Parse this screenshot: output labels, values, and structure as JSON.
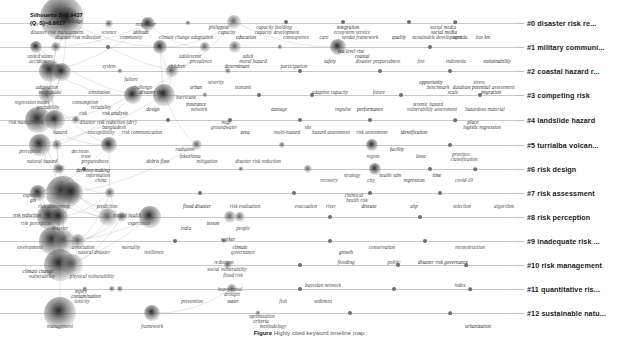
{
  "figure": {
    "type": "timeline-knowledge-map",
    "metrics_line1": "Silhouette S=0.9437",
    "metrics_line2": "(Q, S)=0.8617",
    "caption_label": "Figure",
    "caption_text": "Highly cited keyword timeline map"
  },
  "clusters": [
    {
      "id": "#0",
      "label": "#0 disaster risk re...",
      "y": 23
    },
    {
      "id": "#1",
      "label": "#1 military communi...",
      "y": 47
    },
    {
      "id": "#2",
      "label": "#2 coastal hazard r...",
      "y": 71
    },
    {
      "id": "#3",
      "label": "#3 competing risk",
      "y": 95
    },
    {
      "id": "#4",
      "label": "#4 landslide hazard",
      "y": 120
    },
    {
      "id": "#5",
      "label": "#5 turrialba volcan...",
      "y": 145
    },
    {
      "id": "#6",
      "label": "#6 risk design",
      "y": 169
    },
    {
      "id": "#7",
      "label": "#7 risk assessment",
      "y": 193
    },
    {
      "id": "#8",
      "label": "#8 risk perception",
      "y": 217
    },
    {
      "id": "#9",
      "label": "#9 inadequate risk ...",
      "y": 241
    },
    {
      "id": "#10",
      "label": "#10 risk management",
      "y": 265
    },
    {
      "id": "#11",
      "label": "#11 quantitative ris...",
      "y": 289
    },
    {
      "id": "#12",
      "label": "#12 sustainable natu...",
      "y": 313
    }
  ],
  "terms": [
    {
      "t": "knowledge",
      "x": 72,
      "y": 22
    },
    {
      "t": "responder",
      "x": 146,
      "y": 25
    },
    {
      "t": "philippine",
      "x": 219,
      "y": 28
    },
    {
      "t": "capacity building",
      "x": 274,
      "y": 28
    },
    {
      "t": "integration",
      "x": 348,
      "y": 28
    },
    {
      "t": "social media",
      "x": 443,
      "y": 28
    },
    {
      "t": "disaster risk management",
      "x": 57,
      "y": 33
    },
    {
      "t": "science",
      "x": 109,
      "y": 33
    },
    {
      "t": "attitude",
      "x": 141,
      "y": 33
    },
    {
      "t": "capacity",
      "x": 227,
      "y": 33
    },
    {
      "t": "capacity development",
      "x": 277,
      "y": 33
    },
    {
      "t": "ecosystem service",
      "x": 352,
      "y": 33
    },
    {
      "t": "social media",
      "x": 444,
      "y": 33
    },
    {
      "t": "disaster risk reduction",
      "x": 78,
      "y": 38
    },
    {
      "t": "community",
      "x": 131,
      "y": 38
    },
    {
      "t": "climate change adaptation",
      "x": 186,
      "y": 38
    },
    {
      "t": "education",
      "x": 246,
      "y": 38
    },
    {
      "t": "consequence",
      "x": 296,
      "y": 38
    },
    {
      "t": "care",
      "x": 324,
      "y": 38
    },
    {
      "t": "sendai framework",
      "x": 360,
      "y": 38
    },
    {
      "t": "quality",
      "x": 399,
      "y": 38
    },
    {
      "t": "sustainable development",
      "x": 437,
      "y": 38
    },
    {
      "t": "agenda",
      "x": 460,
      "y": 38
    },
    {
      "t": "bus km",
      "x": 483,
      "y": 38
    },
    {
      "t": "sea level rise",
      "x": 351,
      "y": 52
    },
    {
      "t": "united states",
      "x": 40,
      "y": 57
    },
    {
      "t": "adolescent",
      "x": 190,
      "y": 57
    },
    {
      "t": "adult",
      "x": 248,
      "y": 57
    },
    {
      "t": "coastal",
      "x": 362,
      "y": 57
    },
    {
      "t": "accident",
      "x": 38,
      "y": 62
    },
    {
      "t": "prevalence",
      "x": 201,
      "y": 62
    },
    {
      "t": "moral hazard",
      "x": 253,
      "y": 62
    },
    {
      "t": "safety",
      "x": 330,
      "y": 62
    },
    {
      "t": "disaster preparedness",
      "x": 378,
      "y": 62
    },
    {
      "t": "fire",
      "x": 421,
      "y": 62
    },
    {
      "t": "indonesia",
      "x": 456,
      "y": 62
    },
    {
      "t": "sustainability",
      "x": 497,
      "y": 62
    },
    {
      "t": "disability",
      "x": 52,
      "y": 67
    },
    {
      "t": "system",
      "x": 109,
      "y": 67
    },
    {
      "t": "children",
      "x": 177,
      "y": 67
    },
    {
      "t": "determinant",
      "x": 237,
      "y": 67
    },
    {
      "t": "participation",
      "x": 294,
      "y": 67
    },
    {
      "t": "failure",
      "x": 131,
      "y": 80
    },
    {
      "t": "severity",
      "x": 216,
      "y": 83
    },
    {
      "t": "opportunity",
      "x": 431,
      "y": 83
    },
    {
      "t": "stress",
      "x": 479,
      "y": 83
    },
    {
      "t": "adaptation",
      "x": 47,
      "y": 88
    },
    {
      "t": "challenge",
      "x": 142,
      "y": 88
    },
    {
      "t": "urban",
      "x": 196,
      "y": 88
    },
    {
      "t": "tsunami",
      "x": 243,
      "y": 88
    },
    {
      "t": "benchmark",
      "x": 438,
      "y": 88
    },
    {
      "t": "database",
      "x": 462,
      "y": 88
    },
    {
      "t": "potential",
      "x": 481,
      "y": 88
    },
    {
      "t": "assessment",
      "x": 503,
      "y": 88
    },
    {
      "t": "earthquake",
      "x": 50,
      "y": 93
    },
    {
      "t": "simulation",
      "x": 99,
      "y": 93
    },
    {
      "t": "disaster risk",
      "x": 152,
      "y": 93
    },
    {
      "t": "adaptive capacity",
      "x": 330,
      "y": 93
    },
    {
      "t": "future",
      "x": 379,
      "y": 93
    },
    {
      "t": "scale",
      "x": 453,
      "y": 93
    },
    {
      "t": "migration",
      "x": 491,
      "y": 93
    },
    {
      "t": "hurricane",
      "x": 186,
      "y": 98
    },
    {
      "t": "regression model",
      "x": 32,
      "y": 103
    },
    {
      "t": "consumption",
      "x": 85,
      "y": 103
    },
    {
      "t": "insurance",
      "x": 196,
      "y": 105
    },
    {
      "t": "seismic hazard",
      "x": 428,
      "y": 105
    },
    {
      "t": "probability",
      "x": 48,
      "y": 108
    },
    {
      "t": "reliability",
      "x": 101,
      "y": 108
    },
    {
      "t": "design",
      "x": 153,
      "y": 110
    },
    {
      "t": "network",
      "x": 199,
      "y": 110
    },
    {
      "t": "damage",
      "x": 279,
      "y": 110
    },
    {
      "t": "impulse",
      "x": 343,
      "y": 110
    },
    {
      "t": "performance",
      "x": 370,
      "y": 110
    },
    {
      "t": "vulnerability assessment",
      "x": 432,
      "y": 110
    },
    {
      "t": "hazardous material",
      "x": 485,
      "y": 110
    },
    {
      "t": "risk",
      "x": 83,
      "y": 114
    },
    {
      "t": "risk analysis",
      "x": 115,
      "y": 114
    },
    {
      "t": "risk management",
      "x": 26,
      "y": 123
    },
    {
      "t": "disaster risk reduction (drr)",
      "x": 108,
      "y": 123
    },
    {
      "t": "map",
      "x": 226,
      "y": 123
    },
    {
      "t": "place",
      "x": 473,
      "y": 123
    },
    {
      "t": "bangladesh",
      "x": 114,
      "y": 128
    },
    {
      "t": "groundwater",
      "x": 224,
      "y": 128
    },
    {
      "t": "site",
      "x": 308,
      "y": 128
    },
    {
      "t": "logistic regression",
      "x": 482,
      "y": 128
    },
    {
      "t": "hazard",
      "x": 60,
      "y": 133
    },
    {
      "t": "susceptibility",
      "x": 101,
      "y": 133
    },
    {
      "t": "risk communication",
      "x": 142,
      "y": 133
    },
    {
      "t": "area",
      "x": 245,
      "y": 133
    },
    {
      "t": "multi-hazard",
      "x": 287,
      "y": 133
    },
    {
      "t": "hazard assessment",
      "x": 331,
      "y": 133
    },
    {
      "t": "risk assessment",
      "x": 372,
      "y": 133
    },
    {
      "t": "identification",
      "x": 414,
      "y": 133
    },
    {
      "t": "perception",
      "x": 30,
      "y": 152
    },
    {
      "t": "decision",
      "x": 80,
      "y": 152
    },
    {
      "t": "radiation",
      "x": 185,
      "y": 150
    },
    {
      "t": "facility",
      "x": 397,
      "y": 150
    },
    {
      "t": "trust",
      "x": 86,
      "y": 157
    },
    {
      "t": "fukushima",
      "x": 190,
      "y": 157
    },
    {
      "t": "region",
      "x": 373,
      "y": 157
    },
    {
      "t": "losse",
      "x": 421,
      "y": 157
    },
    {
      "t": "province",
      "x": 461,
      "y": 155
    },
    {
      "t": "natural hazard",
      "x": 42,
      "y": 162
    },
    {
      "t": "preparedness",
      "x": 95,
      "y": 162
    },
    {
      "t": "debris flow",
      "x": 158,
      "y": 162
    },
    {
      "t": "mitigation",
      "x": 207,
      "y": 162
    },
    {
      "t": "disaster risk reduction",
      "x": 258,
      "y": 162
    },
    {
      "t": "classification",
      "x": 464,
      "y": 160
    },
    {
      "t": "decision-making",
      "x": 93,
      "y": 171
    },
    {
      "t": "information",
      "x": 98,
      "y": 176
    },
    {
      "t": "strategy",
      "x": 352,
      "y": 176
    },
    {
      "t": "health sdm",
      "x": 390,
      "y": 176
    },
    {
      "t": "time",
      "x": 437,
      "y": 176
    },
    {
      "t": "china",
      "x": 101,
      "y": 181
    },
    {
      "t": "recovery",
      "x": 329,
      "y": 181
    },
    {
      "t": "city",
      "x": 371,
      "y": 181
    },
    {
      "t": "regression",
      "x": 414,
      "y": 181
    },
    {
      "t": "covid-19",
      "x": 464,
      "y": 181
    },
    {
      "t": "exposure",
      "x": 32,
      "y": 196
    },
    {
      "t": "chemical",
      "x": 354,
      "y": 196
    },
    {
      "t": "gis",
      "x": 33,
      "y": 201
    },
    {
      "t": "health risk",
      "x": 357,
      "y": 201
    },
    {
      "t": "risk assessment",
      "x": 54,
      "y": 207
    },
    {
      "t": "prediction",
      "x": 107,
      "y": 207
    },
    {
      "t": "flood disaster",
      "x": 197,
      "y": 207
    },
    {
      "t": "risk evaluation",
      "x": 245,
      "y": 207
    },
    {
      "t": "evacuation",
      "x": 306,
      "y": 207
    },
    {
      "t": "river",
      "x": 331,
      "y": 207
    },
    {
      "t": "disease",
      "x": 369,
      "y": 207
    },
    {
      "t": "ahp",
      "x": 414,
      "y": 207
    },
    {
      "t": "selection",
      "x": 462,
      "y": 207
    },
    {
      "t": "algorithm",
      "x": 504,
      "y": 207
    },
    {
      "t": "risk reduction",
      "x": 27,
      "y": 216
    },
    {
      "t": "mental health",
      "x": 127,
      "y": 216
    },
    {
      "t": "risk perception",
      "x": 36,
      "y": 224
    },
    {
      "t": "experience",
      "x": 139,
      "y": 224
    },
    {
      "t": "lesson",
      "x": 213,
      "y": 224
    },
    {
      "t": "disaster",
      "x": 60,
      "y": 229
    },
    {
      "t": "india",
      "x": 186,
      "y": 229
    },
    {
      "t": "people",
      "x": 243,
      "y": 229
    },
    {
      "t": "worker",
      "x": 228,
      "y": 240
    },
    {
      "t": "environment",
      "x": 30,
      "y": 248
    },
    {
      "t": "association",
      "x": 83,
      "y": 248
    },
    {
      "t": "mortality",
      "x": 131,
      "y": 248
    },
    {
      "t": "climate",
      "x": 240,
      "y": 248
    },
    {
      "t": "natural disaster",
      "x": 94,
      "y": 253
    },
    {
      "t": "resilience",
      "x": 154,
      "y": 253
    },
    {
      "t": "governance",
      "x": 243,
      "y": 253
    },
    {
      "t": "growth",
      "x": 346,
      "y": 253
    },
    {
      "t": "conservation",
      "x": 382,
      "y": 248
    },
    {
      "t": "reconstruction",
      "x": 470,
      "y": 248
    },
    {
      "t": "reduction",
      "x": 224,
      "y": 263
    },
    {
      "t": "climate change",
      "x": 38,
      "y": 272
    },
    {
      "t": "social vulnerability",
      "x": 227,
      "y": 270
    },
    {
      "t": "flooding",
      "x": 346,
      "y": 263
    },
    {
      "t": "politic",
      "x": 394,
      "y": 263
    },
    {
      "t": "disaster risk governance",
      "x": 443,
      "y": 263
    },
    {
      "t": "vulnerability",
      "x": 42,
      "y": 277
    },
    {
      "t": "physical vulnerability",
      "x": 92,
      "y": 277
    },
    {
      "t": "flood risk",
      "x": 233,
      "y": 276
    },
    {
      "t": "injury",
      "x": 81,
      "y": 292
    },
    {
      "t": "heavy metal",
      "x": 230,
      "y": 290
    },
    {
      "t": "bayesian network",
      "x": 323,
      "y": 286
    },
    {
      "t": "index",
      "x": 460,
      "y": 286
    },
    {
      "t": "contamination",
      "x": 86,
      "y": 297
    },
    {
      "t": "drought",
      "x": 232,
      "y": 295
    },
    {
      "t": "toxicity",
      "x": 82,
      "y": 302
    },
    {
      "t": "prevention",
      "x": 192,
      "y": 302
    },
    {
      "t": "water",
      "x": 233,
      "y": 302
    },
    {
      "t": "fish",
      "x": 283,
      "y": 302
    },
    {
      "t": "sediment",
      "x": 323,
      "y": 302
    },
    {
      "t": "optimization",
      "x": 262,
      "y": 317
    },
    {
      "t": "criteria",
      "x": 261,
      "y": 322
    },
    {
      "t": "management",
      "x": 60,
      "y": 327
    },
    {
      "t": "framework",
      "x": 152,
      "y": 327
    },
    {
      "t": "methodology",
      "x": 273,
      "y": 327
    },
    {
      "t": "urbanization",
      "x": 478,
      "y": 327
    }
  ],
  "nodes": [
    {
      "x": 62,
      "y": 18,
      "r": 22,
      "dark": true
    },
    {
      "x": 67,
      "y": 19,
      "r": 12,
      "dark": true
    },
    {
      "x": 109,
      "y": 24,
      "r": 4
    },
    {
      "x": 148,
      "y": 24,
      "r": 7,
      "dark": true
    },
    {
      "x": 188,
      "y": 23,
      "r": 2.5
    },
    {
      "x": 234,
      "y": 22,
      "r": 7
    },
    {
      "x": 286,
      "y": 22,
      "r": 2
    },
    {
      "x": 343,
      "y": 22,
      "r": 2
    },
    {
      "x": 409,
      "y": 22,
      "r": 2
    },
    {
      "x": 455,
      "y": 22,
      "r": 1.8
    },
    {
      "x": 36,
      "y": 47,
      "r": 6,
      "dark": true
    },
    {
      "x": 56,
      "y": 47,
      "r": 5
    },
    {
      "x": 108,
      "y": 47,
      "r": 2
    },
    {
      "x": 160,
      "y": 47,
      "r": 7,
      "dark": true
    },
    {
      "x": 205,
      "y": 47,
      "r": 5
    },
    {
      "x": 235,
      "y": 47,
      "r": 6
    },
    {
      "x": 280,
      "y": 47,
      "r": 2.5
    },
    {
      "x": 338,
      "y": 47,
      "r": 8,
      "dark": true
    },
    {
      "x": 430,
      "y": 47,
      "r": 2
    },
    {
      "x": 50,
      "y": 71,
      "r": 11,
      "dark": true
    },
    {
      "x": 62,
      "y": 72,
      "r": 9,
      "dark": true
    },
    {
      "x": 120,
      "y": 71,
      "r": 2.5
    },
    {
      "x": 172,
      "y": 71,
      "r": 6.5
    },
    {
      "x": 228,
      "y": 71,
      "r": 3
    },
    {
      "x": 300,
      "y": 71,
      "r": 2
    },
    {
      "x": 380,
      "y": 71,
      "r": 2
    },
    {
      "x": 450,
      "y": 71,
      "r": 2
    },
    {
      "x": 47,
      "y": 95,
      "r": 8
    },
    {
      "x": 133,
      "y": 95,
      "r": 9,
      "dark": true
    },
    {
      "x": 164,
      "y": 95,
      "r": 11,
      "dark": true
    },
    {
      "x": 205,
      "y": 95,
      "r": 2.5
    },
    {
      "x": 259,
      "y": 95,
      "r": 2
    },
    {
      "x": 312,
      "y": 95,
      "r": 2
    },
    {
      "x": 401,
      "y": 95,
      "r": 2
    },
    {
      "x": 480,
      "y": 95,
      "r": 2
    },
    {
      "x": 38,
      "y": 120,
      "r": 13,
      "dark": true
    },
    {
      "x": 55,
      "y": 120,
      "r": 10,
      "dark": true
    },
    {
      "x": 76,
      "y": 120,
      "r": 4
    },
    {
      "x": 168,
      "y": 120,
      "r": 2
    },
    {
      "x": 230,
      "y": 120,
      "r": 2
    },
    {
      "x": 300,
      "y": 120,
      "r": 2
    },
    {
      "x": 370,
      "y": 120,
      "r": 2
    },
    {
      "x": 455,
      "y": 120,
      "r": 1.8
    },
    {
      "x": 40,
      "y": 145,
      "r": 11,
      "dark": true
    },
    {
      "x": 57,
      "y": 145,
      "r": 5
    },
    {
      "x": 109,
      "y": 145,
      "r": 8,
      "dark": true
    },
    {
      "x": 197,
      "y": 145,
      "r": 5
    },
    {
      "x": 282,
      "y": 145,
      "r": 3
    },
    {
      "x": 372,
      "y": 145,
      "r": 6,
      "dark": true
    },
    {
      "x": 450,
      "y": 145,
      "r": 2
    },
    {
      "x": 58,
      "y": 169,
      "r": 5
    },
    {
      "x": 61,
      "y": 169,
      "r": 4
    },
    {
      "x": 84,
      "y": 169,
      "r": 2
    },
    {
      "x": 241,
      "y": 169,
      "r": 2.5
    },
    {
      "x": 308,
      "y": 169,
      "r": 4
    },
    {
      "x": 375,
      "y": 169,
      "r": 6,
      "dark": true
    },
    {
      "x": 430,
      "y": 169,
      "r": 2
    },
    {
      "x": 475,
      "y": 169,
      "r": 1.8
    },
    {
      "x": 38,
      "y": 193,
      "r": 8,
      "dark": true
    },
    {
      "x": 63,
      "y": 193,
      "r": 17,
      "dark": true
    },
    {
      "x": 72,
      "y": 193,
      "r": 11,
      "dark": true
    },
    {
      "x": 110,
      "y": 193,
      "r": 5
    },
    {
      "x": 200,
      "y": 193,
      "r": 2
    },
    {
      "x": 294,
      "y": 193,
      "r": 2
    },
    {
      "x": 370,
      "y": 193,
      "r": 2
    },
    {
      "x": 440,
      "y": 193,
      "r": 2
    },
    {
      "x": 50,
      "y": 217,
      "r": 13,
      "dark": true
    },
    {
      "x": 59,
      "y": 217,
      "r": 9,
      "dark": true
    },
    {
      "x": 108,
      "y": 217,
      "r": 9
    },
    {
      "x": 122,
      "y": 217,
      "r": 5
    },
    {
      "x": 150,
      "y": 217,
      "r": 11,
      "dark": true
    },
    {
      "x": 230,
      "y": 217,
      "r": 6
    },
    {
      "x": 240,
      "y": 217,
      "r": 5
    },
    {
      "x": 330,
      "y": 217,
      "r": 2
    },
    {
      "x": 420,
      "y": 217,
      "r": 2
    },
    {
      "x": 53,
      "y": 241,
      "r": 14,
      "dark": true
    },
    {
      "x": 64,
      "y": 241,
      "r": 11
    },
    {
      "x": 78,
      "y": 241,
      "r": 7
    },
    {
      "x": 175,
      "y": 241,
      "r": 2
    },
    {
      "x": 224,
      "y": 241,
      "r": 2.5
    },
    {
      "x": 330,
      "y": 241,
      "r": 2
    },
    {
      "x": 425,
      "y": 241,
      "r": 2
    },
    {
      "x": 60,
      "y": 265,
      "r": 16,
      "dark": true
    },
    {
      "x": 72,
      "y": 265,
      "r": 11
    },
    {
      "x": 228,
      "y": 265,
      "r": 4
    },
    {
      "x": 300,
      "y": 265,
      "r": 2
    },
    {
      "x": 398,
      "y": 265,
      "r": 2
    },
    {
      "x": 466,
      "y": 265,
      "r": 1.8
    },
    {
      "x": 85,
      "y": 289,
      "r": 2.5
    },
    {
      "x": 112,
      "y": 289,
      "r": 3
    },
    {
      "x": 120,
      "y": 289,
      "r": 3
    },
    {
      "x": 232,
      "y": 289,
      "r": 5
    },
    {
      "x": 300,
      "y": 289,
      "r": 2
    },
    {
      "x": 394,
      "y": 289,
      "r": 2
    },
    {
      "x": 470,
      "y": 289,
      "r": 1.8
    },
    {
      "x": 60,
      "y": 313,
      "r": 16,
      "dark": true
    },
    {
      "x": 152,
      "y": 313,
      "r": 8,
      "dark": true
    },
    {
      "x": 258,
      "y": 313,
      "r": 2.5
    },
    {
      "x": 350,
      "y": 313,
      "r": 2
    },
    {
      "x": 450,
      "y": 313,
      "r": 1.8
    }
  ]
}
